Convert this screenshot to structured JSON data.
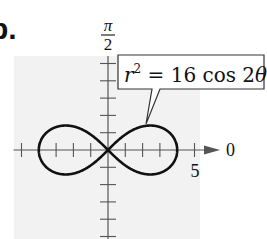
{
  "part_label": "b.",
  "chart_data": {
    "type": "line",
    "subtype": "polar",
    "title": "",
    "equation_label": "r² = 16 cos 2θ",
    "equation": {
      "r_squared_coefficient": 16,
      "function": "cos",
      "theta_multiplier": 2
    },
    "axis_labels": {
      "polar_axis": "0",
      "vertical_axis_numerator": "π",
      "vertical_axis_denominator": "2"
    },
    "tick_labels": [
      {
        "value": 5,
        "label": "5"
      }
    ],
    "tick_spacing": 1,
    "xlim": [
      -5,
      5
    ],
    "ylim": [
      -5,
      3
    ],
    "grid": false,
    "max_radius": 4,
    "points": [
      {
        "theta_deg": 0,
        "r": 4
      },
      {
        "theta_deg": 15,
        "r": 3.72
      },
      {
        "theta_deg": 30,
        "r": 2.83
      },
      {
        "theta_deg": 40,
        "r": 1.66
      },
      {
        "theta_deg": 45,
        "r": 0
      },
      {
        "theta_deg": 180,
        "r": 4
      },
      {
        "theta_deg": 195,
        "r": 3.72
      },
      {
        "theta_deg": 210,
        "r": 2.83
      },
      {
        "theta_deg": 225,
        "r": 0
      }
    ]
  },
  "colors": {
    "curve": "#111111",
    "axis": "#555555",
    "background_panel": "#f2f2f2",
    "callout_border": "#333333"
  }
}
